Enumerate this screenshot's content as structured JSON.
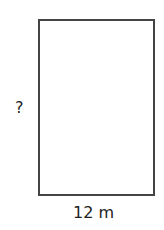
{
  "diagram": {
    "shape": "rectangle",
    "side_label": "?",
    "bottom_label": "12 m",
    "stroke_color": "#444444"
  }
}
